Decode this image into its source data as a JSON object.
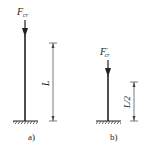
{
  "figure": {
    "panel_a": {
      "force_label": "F",
      "force_subscript": "cr",
      "length_label": "L",
      "caption": "a)"
    },
    "panel_b": {
      "force_label": "F",
      "force_prime": "′",
      "force_subscript": "cr",
      "length_label": "L/2",
      "caption": "b)"
    },
    "colors": {
      "ink": "#222222",
      "background": "#ffffff"
    }
  }
}
